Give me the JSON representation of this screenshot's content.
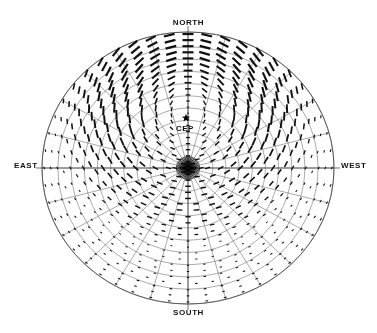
{
  "figure": {
    "title": "",
    "background_color": "#ffffff",
    "width": 377,
    "height": 333
  },
  "labels": {
    "north": "NORTH",
    "south": "SOUTH",
    "east": "EAST",
    "west": "WEST",
    "cep": "CEP"
  },
  "markers": {
    "cep_marker": "star",
    "cep_marker_color": "#000000",
    "zenith_marker": "convergence-point"
  },
  "chart_data": {
    "type": "scatter",
    "subtype": "polar-vector-field",
    "title": "",
    "xlabel": "",
    "ylabel": "",
    "projection": "all-sky-polar",
    "grid": true,
    "grid_color": "#555555",
    "vector_color": "#111111",
    "legend_position": "none",
    "center": {
      "x": 188,
      "y": 168,
      "label": "zenith"
    },
    "outer_radius_x": 146,
    "outer_radius_y": 136,
    "annotations": [
      {
        "text": "NORTH",
        "position": "top",
        "x": 188,
        "y": 23
      },
      {
        "text": "SOUTH",
        "position": "bottom",
        "x": 188,
        "y": 313
      },
      {
        "text": "EAST",
        "position": "left",
        "x": 28,
        "y": 168
      },
      {
        "text": "WEST",
        "position": "right",
        "x": 352,
        "y": 168
      },
      {
        "text": "CEP",
        "position": "upper-center",
        "x": 186,
        "y": 129
      }
    ],
    "cep_point": {
      "x": 186,
      "y": 118,
      "azimuth_deg": 0,
      "zenith_angle_deg": 37
    },
    "radial_rings": [
      0.08,
      0.17,
      0.26,
      0.35,
      0.44,
      0.53,
      0.62,
      0.71,
      0.8,
      0.89,
      1.0
    ],
    "azimuth_spokes_deg": [
      0,
      15,
      30,
      45,
      60,
      75,
      90,
      105,
      120,
      135,
      150,
      165,
      180,
      195,
      210,
      225,
      240,
      255,
      270,
      285,
      300,
      315,
      330,
      345
    ],
    "meridian_lines": [
      "north-south",
      "east-west"
    ],
    "vector_grid": {
      "n_rings": 22,
      "n_azimuths": 48,
      "vector_orientation_rule": "tangential-to-cep",
      "vector_length_rule": "proportional-to-polarization-degree",
      "max_vector_px": 11,
      "min_vector_px": 1
    },
    "series": [
      {
        "name": "polarization vectors",
        "description": "Line segments whose orientation traces circles centered on the CEP and whose length scales with degree of linear polarization; length grows from zero at the CEP toward the horizon."
      }
    ],
    "ylim": [
      0,
      1
    ],
    "xlim": [
      0,
      1
    ]
  }
}
